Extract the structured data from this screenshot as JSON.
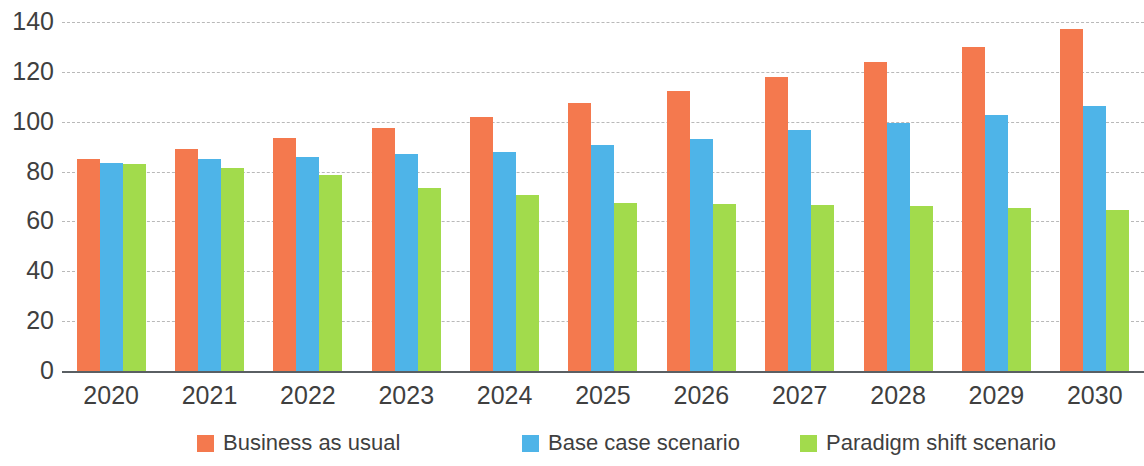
{
  "chart_data": {
    "type": "bar",
    "title": "",
    "subtitle": "",
    "xlabel": "",
    "ylabel": "",
    "ylim": [
      0,
      140
    ],
    "yticks": [
      0,
      20,
      40,
      60,
      80,
      100,
      120,
      140
    ],
    "grid": true,
    "grid_style": "dashed-horizontal",
    "legend_position": "bottom",
    "categories": [
      "2020",
      "2021",
      "2022",
      "2023",
      "2024",
      "2025",
      "2026",
      "2027",
      "2028",
      "2029",
      "2030"
    ],
    "series": [
      {
        "name": "Business as usual",
        "color": "#f4794e",
        "values": [
          85,
          89,
          93.5,
          97.5,
          102,
          107.5,
          112.5,
          118,
          124,
          130,
          137
        ]
      },
      {
        "name": "Base case scenario",
        "color": "#4eb4e8",
        "values": [
          83.5,
          85,
          86,
          87,
          88,
          90.5,
          93,
          96.5,
          99.5,
          102.5,
          106.5
        ]
      },
      {
        "name": "Paradigm shift scenario",
        "color": "#a2db4c",
        "values": [
          83,
          81.5,
          78.5,
          73.5,
          70.5,
          67.5,
          67,
          66.5,
          66,
          65.5,
          64.5
        ]
      }
    ]
  },
  "colors": {
    "series_1": "#f4794e",
    "series_2": "#4eb4e8",
    "series_3": "#a2db4c",
    "gridline": "#b9b9b9",
    "axis": "#5a5f63",
    "text": "#3f3f3f",
    "background": "#ffffff"
  }
}
